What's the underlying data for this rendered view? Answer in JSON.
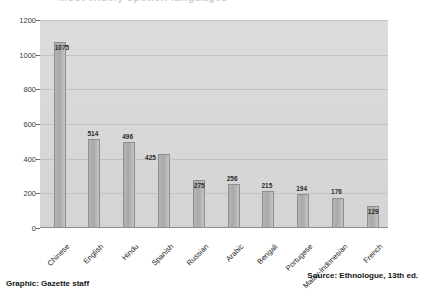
{
  "title_sliver": "Most widely spoken languages",
  "footer": {
    "left": "Graphic: Gazette staff",
    "right": "Source: Ethnologue, 13th ed."
  },
  "chart_data": {
    "type": "bar",
    "title": "",
    "xlabel": "",
    "ylabel": "",
    "ylim": [
      0,
      1200
    ],
    "yticks": [
      0,
      200,
      400,
      600,
      800,
      1000,
      1200
    ],
    "ytick_labels": [
      "0",
      "200",
      "400",
      "600",
      "800",
      "1000",
      "1200"
    ],
    "grid": true,
    "legend": "none",
    "categories": [
      "Chinese",
      "English",
      "Hindu",
      "Spanish",
      "Russian",
      "Arabic",
      "Bengali",
      "Portugese",
      "Malay-Indonesian",
      "French"
    ],
    "values": [
      1075,
      514,
      496,
      425,
      275,
      256,
      215,
      194,
      176,
      129
    ],
    "value_labels": [
      "1075",
      "514",
      "496",
      "425",
      "275",
      "256",
      "215",
      "194",
      "176",
      "129"
    ],
    "colors": {
      "bar": "#b0b0b0",
      "bar_border": "#8f8f8f",
      "plot_background": "#d8d8d8",
      "gridline": "#c2c2c2",
      "text": "#222222"
    }
  }
}
